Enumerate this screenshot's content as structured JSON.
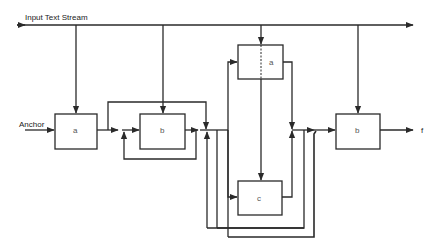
{
  "diagram": {
    "input_label": "Input Text Stream",
    "anchor_label": "Anchor",
    "output_label": "f",
    "boxes": {
      "a1": "a",
      "b1": "b",
      "a2": "a",
      "c": "c",
      "b2": "b"
    },
    "line_color": "#2a2a2a",
    "background": "#ffffff"
  }
}
